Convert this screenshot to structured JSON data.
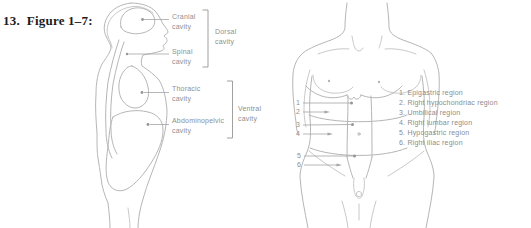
{
  "title": {
    "item_number": "13.",
    "figure_label": "Figure 1–7:"
  },
  "colors": {
    "background": "#ffffff",
    "line_art": "#b6b6b6",
    "label_text": "#8f8f8f",
    "title_text": "#1c1c1c"
  },
  "sagittal_figure": {
    "description": "Side view of body showing dorsal and ventral cavities",
    "labels": {
      "cranial": "Cranial\ncavity",
      "spinal": "Spinal\ncavity",
      "thoracic": "Thoracic\ncavity",
      "abdominopelvic": "Abdominopelvic\ncavity",
      "dorsal": "Dorsal\ncavity",
      "ventral": "Ventral\ncavity"
    }
  },
  "regions_figure": {
    "description": "Anterior torso showing abdominopelvic regions",
    "markers": [
      "1",
      "2",
      "3",
      "4",
      "5",
      "6"
    ],
    "legend": [
      "1. Epigastric region",
      "2. Right hypochondriac region",
      "3. Umbilical region",
      "4. Right lumbar region",
      "5. Hypogastric region",
      "6. Right iliac region"
    ]
  }
}
